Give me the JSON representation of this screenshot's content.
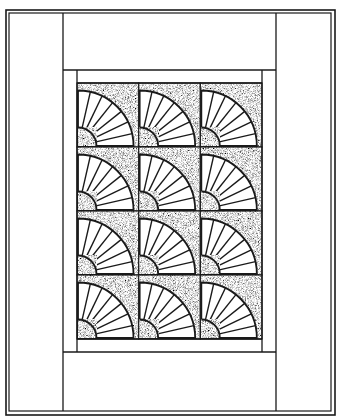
{
  "figure": {
    "colors": {
      "ink": "#1a1a1a",
      "paper": "#ffffff",
      "stipple_base": "#6e6e6e"
    }
  },
  "quilt": {
    "outer_frame": {
      "outer": [
        6,
        10,
        335,
        415
      ],
      "inner": [
        9,
        13,
        331,
        411
      ]
    },
    "side_panel_lines": {
      "left_x": 63,
      "right_x": 276
    },
    "top_band_y": 70,
    "bottom_band_y": 352,
    "sash": {
      "x0": 63,
      "y0": 70,
      "x1": 276,
      "y1": 352
    },
    "inner_border": {
      "x0": 77,
      "y0": 83,
      "x1": 262,
      "y1": 339
    },
    "grid": {
      "columns": 3,
      "rows": 4
    },
    "block": {
      "motif": "fan",
      "anchor": "bottom-left",
      "blades": 7,
      "outer_radius_ratio": 0.9,
      "inner_radius_ratio": 0.3
    },
    "block_count": 12
  }
}
